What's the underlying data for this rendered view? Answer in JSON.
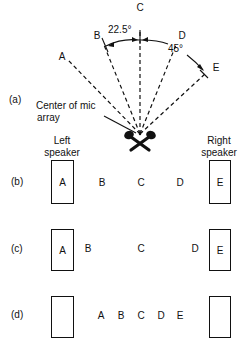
{
  "panel_a": {
    "label": "(a)",
    "directions": [
      "A",
      "B",
      "C",
      "D",
      "E"
    ],
    "angle_small": "22.5°",
    "angle_large": "45°",
    "center_caption_line1": "Center of mic",
    "center_caption_line2": "array",
    "mic_icon": "crossed-microphones-icon"
  },
  "speakers": {
    "left_line1": "Left",
    "left_line2": "speaker",
    "right_line1": "Right",
    "right_line2": "speaker"
  },
  "panel_b": {
    "label": "(b)",
    "left_box": "A",
    "between": [
      "B",
      "C",
      "D"
    ],
    "right_box": "E"
  },
  "panel_c": {
    "label": "(c)",
    "left_box": "A",
    "between": [
      "B",
      "C",
      "D"
    ],
    "right_box": "E"
  },
  "panel_d": {
    "label": "(d)",
    "left_box": "",
    "between": [
      "A",
      "B",
      "C",
      "D",
      "E"
    ],
    "right_box": ""
  }
}
